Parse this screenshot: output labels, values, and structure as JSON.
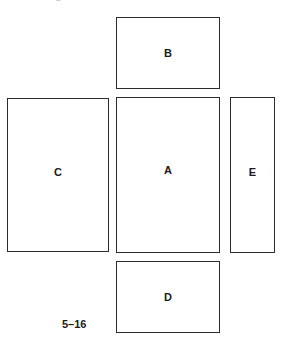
{
  "figure": {
    "caption": "5–16",
    "clipped_header_text": "—— ——— D ————",
    "diagram_type": "box-net-cross-layout",
    "stroke_color": "#2b2b2b",
    "fill_color": "#ffffff"
  },
  "panels": [
    {
      "id": "b",
      "label": "B",
      "position": "top"
    },
    {
      "id": "c",
      "label": "C",
      "position": "left"
    },
    {
      "id": "a",
      "label": "A",
      "position": "center"
    },
    {
      "id": "e",
      "label": "E",
      "position": "right"
    },
    {
      "id": "d",
      "label": "D",
      "position": "bottom"
    }
  ]
}
